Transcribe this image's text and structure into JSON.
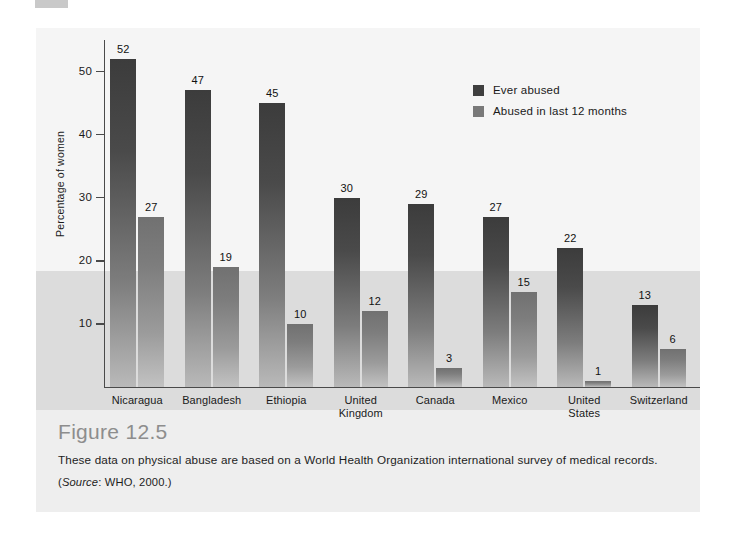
{
  "figure": {
    "number_label": "Figure 12.5",
    "caption": "These data on physical abuse are based on a World Health Organization international survey of medical records.",
    "source_prefix": "(",
    "source_italic": "Source",
    "source_rest": ": WHO, 2000.)"
  },
  "legend": {
    "position": "inside-top-right",
    "entries": [
      {
        "label": "Ever abused",
        "color": "#3f3f3f"
      },
      {
        "label": "Abused in last 12 months",
        "color": "#797979"
      }
    ]
  },
  "axes": {
    "y_title": "Percentage of women",
    "y_ticks": [
      "10",
      "20",
      "30",
      "40",
      "50"
    ]
  },
  "chart_data": {
    "type": "bar",
    "title": "Figure 12.5",
    "xlabel": "",
    "ylabel": "Percentage of women",
    "ylim": [
      0,
      55
    ],
    "yticks": [
      10,
      20,
      30,
      40,
      50
    ],
    "grid": false,
    "legend_position": "inside-top-right",
    "categories": [
      "Nicaragua",
      "Bangladesh",
      "Ethiopia",
      "United Kingdom",
      "Canada",
      "Mexico",
      "United States",
      "Switzerland"
    ],
    "category_lines": [
      [
        "Nicaragua"
      ],
      [
        "Bangladesh"
      ],
      [
        "Ethiopia"
      ],
      [
        "United",
        "Kingdom"
      ],
      [
        "Canada"
      ],
      [
        "Mexico"
      ],
      [
        "United",
        "States"
      ],
      [
        "Switzerland"
      ]
    ],
    "series": [
      {
        "name": "Ever abused",
        "color": "#3f3f3f",
        "values": [
          52,
          47,
          45,
          30,
          29,
          27,
          22,
          13
        ]
      },
      {
        "name": "Abused in last 12 months",
        "color": "#797979",
        "values": [
          27,
          19,
          10,
          12,
          3,
          15,
          1,
          6
        ]
      }
    ],
    "annotations": {
      "background_band_split_value": 18.5,
      "band_upper_color": "#f5f5f5",
      "band_lower_color": "#dcdcdc"
    }
  }
}
